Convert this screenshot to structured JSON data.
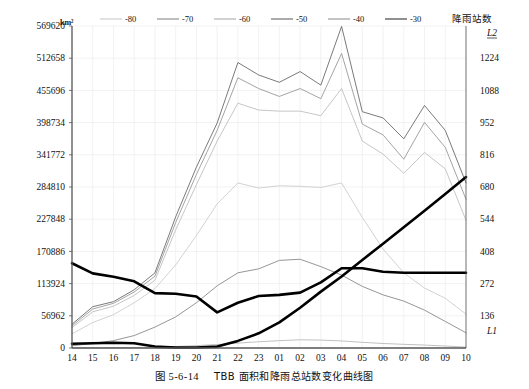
{
  "figure": {
    "caption_number": "图 5-6-14",
    "caption_text": "TBB 面积和降雨总站数变化曲线图",
    "left_unit": "km²",
    "right_axis_title": "降雨站数",
    "series_label_l1": "L1",
    "series_label_l2": "L2"
  },
  "legend": {
    "position": "top",
    "items": [
      {
        "label": "-80",
        "color": "#d9d9d9"
      },
      {
        "label": "-70",
        "color": "#a8a8a8"
      },
      {
        "label": "-60",
        "color": "#c2c2c2"
      },
      {
        "label": "-50",
        "color": "#8f8f8f"
      },
      {
        "label": "-40",
        "color": "#b0b0b0"
      },
      {
        "label": "-30",
        "color": "#6b6b6b"
      }
    ]
  },
  "chart_data": {
    "type": "line",
    "title": "TBB 面积和降雨总站数变化曲线图",
    "xlabel": "",
    "ylabel": "km²",
    "y2label": "降雨站数",
    "grid": true,
    "x": [
      "14",
      "15",
      "16",
      "17",
      "18",
      "19",
      "20",
      "21",
      "22",
      "23",
      "01",
      "02",
      "03",
      "04",
      "05",
      "06",
      "07",
      "08",
      "09",
      "10"
    ],
    "ylim": [
      0,
      569620
    ],
    "yticks": [
      0,
      56962,
      113924,
      170886,
      227848,
      284810,
      341772,
      398734,
      455696,
      512658,
      569620
    ],
    "y2lim": [
      0,
      1360
    ],
    "y2ticks": [
      136,
      272,
      408,
      544,
      680,
      816,
      952,
      1088,
      1224
    ],
    "series": [
      {
        "name": "-30",
        "color": "#6b6b6b",
        "axis": "left",
        "values": [
          42000,
          73000,
          82000,
          103000,
          133000,
          232000,
          320000,
          398000,
          505000,
          483000,
          470000,
          489000,
          465000,
          569000,
          418000,
          407000,
          370000,
          429000,
          385000,
          292000
        ]
      },
      {
        "name": "-40",
        "color": "#9a9a9a",
        "axis": "left",
        "values": [
          39000,
          69000,
          79000,
          99000,
          127000,
          222000,
          307000,
          385000,
          478000,
          459000,
          445000,
          459000,
          441000,
          521000,
          396000,
          377000,
          334000,
          399000,
          355000,
          263000
        ]
      },
      {
        "name": "-50",
        "color": "#c0c0c0",
        "axis": "left",
        "values": [
          36000,
          64000,
          74000,
          93000,
          120000,
          209000,
          289000,
          366000,
          433000,
          421000,
          419000,
          419000,
          411000,
          459000,
          366000,
          343000,
          309000,
          346000,
          317000,
          226000
        ]
      },
      {
        "name": "-60",
        "color": "#cdcdcd",
        "axis": "left",
        "values": [
          25000,
          45000,
          59000,
          80000,
          105000,
          147000,
          199000,
          255000,
          292000,
          283000,
          287000,
          286000,
          284000,
          292000,
          231000,
          175000,
          133000,
          106000,
          88000,
          60000
        ]
      },
      {
        "name": "-70",
        "color": "#8a8a8a",
        "axis": "left",
        "values": [
          4000,
          8000,
          13000,
          22000,
          37000,
          55000,
          80000,
          110000,
          133000,
          140000,
          155000,
          157000,
          144000,
          129000,
          109000,
          94000,
          83000,
          67000,
          47000,
          27000
        ]
      },
      {
        "name": "-80",
        "color": "#b9b9b9",
        "axis": "left",
        "values": [
          0,
          300,
          500,
          900,
          1500,
          2600,
          4200,
          6200,
          8600,
          11000,
          13000,
          14500,
          14000,
          12500,
          10000,
          8000,
          6500,
          5200,
          3500,
          1500
        ]
      },
      {
        "name": "L1",
        "color": "#000000",
        "axis": "left",
        "values": [
          150000,
          132000,
          126000,
          118000,
          97000,
          96000,
          91000,
          63000,
          80000,
          92000,
          94000,
          98000,
          116000,
          141000,
          141000,
          135000,
          133000,
          133000,
          133000,
          133000
        ]
      },
      {
        "name": "L2",
        "color": "#000000",
        "axis": "right",
        "values": [
          18,
          20,
          22,
          20,
          6,
          2,
          2,
          6,
          30,
          62,
          108,
          170,
          238,
          302,
          372,
          440,
          510,
          580,
          650,
          722
        ]
      }
    ]
  }
}
